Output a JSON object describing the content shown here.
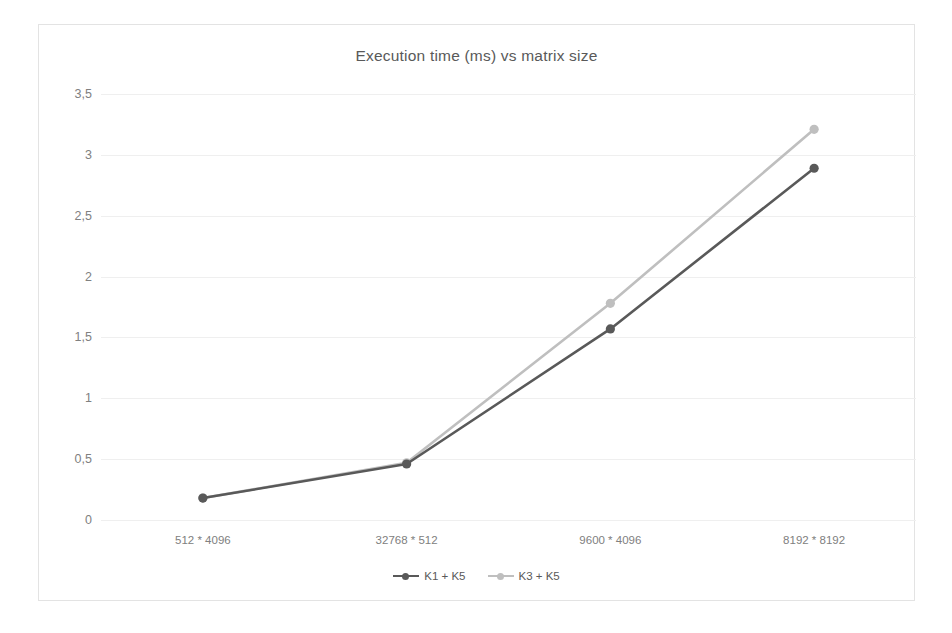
{
  "chart_data": {
    "type": "line",
    "title": "Execution time (ms) vs matrix size",
    "xlabel": "",
    "ylabel": "",
    "categories": [
      "512 * 4096",
      "32768 * 512",
      "9600 * 4096",
      "8192 * 8192"
    ],
    "series": [
      {
        "name": "K1 + K5",
        "color": "#595959",
        "values": [
          0.18,
          0.46,
          1.57,
          2.89
        ]
      },
      {
        "name": "K3 + K5",
        "color": "#bfbfbf",
        "values": [
          0.18,
          0.47,
          1.78,
          3.21
        ]
      }
    ],
    "ylim": [
      0,
      3.5
    ],
    "yticks": [
      0,
      0.5,
      1,
      1.5,
      2,
      2.5,
      3,
      3.5
    ],
    "ytick_labels": [
      "0",
      "0,5",
      "1",
      "1,5",
      "2",
      "2,5",
      "3",
      "3,5"
    ],
    "grid": "horizontal",
    "legend_position": "bottom",
    "grid_color": "#efefef",
    "axis_text_color": "#808080",
    "title_color": "#595959",
    "frame_color": "#e3e3e3",
    "background": "#ffffff"
  }
}
